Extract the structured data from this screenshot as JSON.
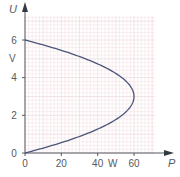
{
  "chart_data": {
    "type": "line",
    "title": "",
    "xlabel": "P",
    "xunit": "W",
    "ylabel": "U",
    "yunit": "V",
    "xlim": [
      0,
      72
    ],
    "ylim": [
      0,
      7.5
    ],
    "xticks": [
      0,
      20,
      40,
      60
    ],
    "yticks": [
      0,
      2,
      4,
      6
    ],
    "grid": true,
    "legend": null,
    "series": [
      {
        "name": "P(U)",
        "color": "#4a5578",
        "points": [
          {
            "x": 0,
            "y": 0
          },
          {
            "x": 11.7,
            "y": 0.5
          },
          {
            "x": 21.7,
            "y": 1.0
          },
          {
            "x": 30.0,
            "y": 1.5
          },
          {
            "x": 40.0,
            "y": 2.0
          },
          {
            "x": 52.5,
            "y": 2.5
          },
          {
            "x": 60.0,
            "y": 3.0
          },
          {
            "x": 52.5,
            "y": 3.5
          },
          {
            "x": 40.0,
            "y": 4.0
          },
          {
            "x": 30.0,
            "y": 4.5
          },
          {
            "x": 21.7,
            "y": 5.0
          },
          {
            "x": 11.7,
            "y": 5.5
          },
          {
            "x": 0,
            "y": 6.0
          }
        ]
      }
    ],
    "annotations": [
      "Curve is a parabola in U with vertex at P = 60 W, U = 3 V; intercepts at U = 0 and U = 6 V"
    ]
  },
  "colors": {
    "axis": "#555a60",
    "grid_minor": "#f3e3e6",
    "grid_major": "#ebd2d7",
    "curve": "#4a5578"
  }
}
